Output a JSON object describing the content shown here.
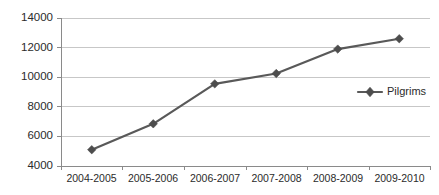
{
  "chart_data": {
    "type": "line",
    "title": "",
    "xlabel": "",
    "ylabel": "",
    "categories": [
      "2004-2005",
      "2005-2006",
      "2006-2007",
      "2007-2008",
      "2008-2009",
      "2009-2010"
    ],
    "series": [
      {
        "name": "Pilgrims",
        "values": [
          5100,
          6850,
          9550,
          10250,
          11900,
          12600
        ],
        "color": "#595959",
        "marker": "diamond"
      }
    ],
    "ylim": [
      4000,
      14000
    ],
    "yticks": [
      4000,
      6000,
      8000,
      10000,
      12000,
      14000
    ],
    "ytick_labels": [
      "4000",
      "6000",
      "8000",
      "10000",
      "12000",
      "14000"
    ],
    "grid": true,
    "grid_axis": "y",
    "legend": {
      "position": "right-middle",
      "entries": [
        "Pilgrims"
      ]
    }
  },
  "legend": {
    "pilgrims_label": "Pilgrims"
  },
  "axes": {
    "y_labels": [
      "14000",
      "12000",
      "10000",
      "8000",
      "6000",
      "4000"
    ],
    "x_labels": [
      "2004-2005",
      "2005-2006",
      "2006-2007",
      "2007-2008",
      "2008-2009",
      "2009-2010"
    ]
  },
  "colors": {
    "series": "#595959",
    "marker": "#4d4d4d",
    "grid": "#b9b9b9",
    "axis": "#8a8a8a",
    "text": "#2b2b2b",
    "background": "#ffffff"
  }
}
